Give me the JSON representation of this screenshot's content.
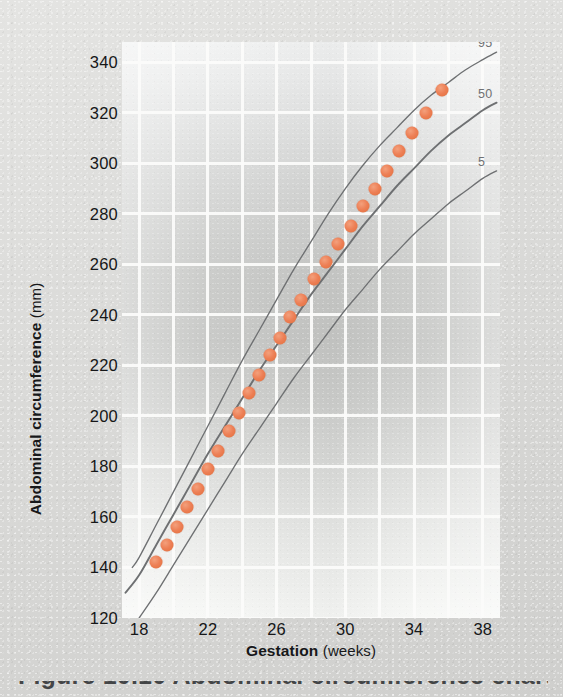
{
  "figure": {
    "caption": "Figure 10.10 Abdominal circumference chart"
  },
  "chart_data": {
    "type": "line",
    "title": "",
    "xlabel": "Gestation",
    "xlabel_unit": "(weeks)",
    "ylabel": "Abdominal circumference",
    "ylabel_unit": "(mm)",
    "xlim": [
      17,
      39
    ],
    "ylim": [
      120,
      348
    ],
    "xticks": [
      18,
      22,
      26,
      30,
      34,
      38
    ],
    "yticks": [
      120,
      140,
      160,
      180,
      200,
      220,
      240,
      260,
      280,
      300,
      320,
      340
    ],
    "grid": true,
    "legend_position": "right-end-of-curve",
    "curve_color": "#6e7072",
    "point_color": "#ed7f55",
    "series": [
      {
        "name": "95",
        "label": "95",
        "type": "percentile-curve",
        "x": [
          17.6,
          18,
          19,
          20,
          21,
          22,
          23,
          24,
          25,
          26,
          27,
          28,
          29,
          30,
          31,
          32,
          33,
          34,
          35,
          36,
          37,
          38,
          38.8
        ],
        "values": [
          140,
          144,
          157,
          170,
          183,
          196,
          209,
          222,
          234,
          246,
          258,
          269,
          280,
          290,
          299,
          307,
          314,
          321,
          327,
          332,
          337,
          341,
          344
        ]
      },
      {
        "name": "50",
        "label": "50",
        "type": "percentile-curve",
        "x": [
          17.2,
          18,
          19,
          20,
          21,
          22,
          23,
          24,
          25,
          26,
          27,
          28,
          29,
          30,
          31,
          32,
          33,
          34,
          35,
          36,
          37,
          38,
          38.8
        ],
        "values": [
          130,
          137,
          149,
          161,
          173,
          185,
          196,
          207,
          218,
          228,
          238,
          248,
          257,
          266,
          275,
          283,
          291,
          298,
          305,
          311,
          316,
          321,
          324
        ]
      },
      {
        "name": "5",
        "label": "5",
        "type": "percentile-curve",
        "x": [
          18,
          19,
          20,
          21,
          22,
          23,
          24,
          25,
          26,
          27,
          28,
          29,
          30,
          31,
          32,
          33,
          34,
          35,
          36,
          37,
          38,
          38.8
        ],
        "values": [
          120,
          130,
          141,
          152,
          163,
          174,
          185,
          195,
          205,
          215,
          224,
          233,
          242,
          250,
          258,
          265,
          272,
          278,
          284,
          289,
          294,
          297
        ]
      },
      {
        "name": "measurements",
        "label": "",
        "type": "scatter",
        "x": [
          19.0,
          19.6,
          20.2,
          20.8,
          21.4,
          22.0,
          22.6,
          23.2,
          23.8,
          24.4,
          25.0,
          25.6,
          26.2,
          26.8,
          27.4,
          28.2,
          28.9,
          29.6,
          30.3,
          31.0,
          31.7,
          32.4,
          33.1,
          33.9,
          34.7,
          35.6
        ],
        "values": [
          142,
          149,
          156,
          164,
          171,
          179,
          186,
          194,
          201,
          209,
          216,
          224,
          231,
          239,
          246,
          254,
          261,
          268,
          275,
          283,
          290,
          297,
          305,
          312,
          320,
          329
        ]
      }
    ]
  },
  "axis": {
    "y_ticks_labels": [
      "340",
      "320",
      "300",
      "280",
      "260",
      "240",
      "220",
      "200",
      "180",
      "160",
      "140",
      "120"
    ],
    "x_ticks_labels": [
      "18",
      "22",
      "26",
      "30",
      "34",
      "38"
    ]
  },
  "percentile_labels": [
    {
      "text": "95"
    },
    {
      "text": "50"
    },
    {
      "text": "5"
    }
  ]
}
